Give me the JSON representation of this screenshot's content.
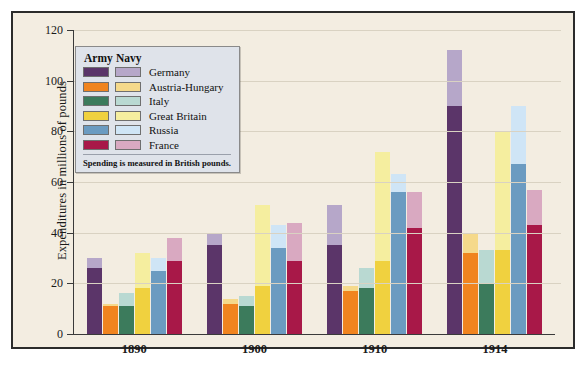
{
  "chart_data": {
    "type": "bar",
    "title": "",
    "subtitle": "",
    "xlabel": "",
    "ylabel": "Expenditures in millions of pounds",
    "categories": [
      "1890",
      "1900",
      "1910",
      "1914"
    ],
    "ylim": [
      0,
      120
    ],
    "yticks": [
      0,
      20,
      40,
      60,
      80,
      100,
      120
    ],
    "grid": true,
    "stacked": true,
    "stack_parts": [
      "Army",
      "Navy"
    ],
    "legend_position": "inside-top-left",
    "note": "Spending is measured in British pounds.",
    "series": [
      {
        "name": "Germany",
        "army_color": "#5b3569",
        "navy_color": "#b6a7c9",
        "army": [
          26,
          35,
          35,
          90
        ],
        "navy": [
          4,
          5,
          16,
          22
        ],
        "values": [
          30,
          40,
          51,
          112
        ]
      },
      {
        "name": "Austria-Hungary",
        "army_color": "#f0841f",
        "navy_color": "#f5d98b",
        "army": [
          11,
          12,
          17,
          32
        ],
        "navy": [
          1,
          2,
          2,
          8
        ],
        "values": [
          12,
          14,
          19,
          40
        ]
      },
      {
        "name": "Italy",
        "army_color": "#3c7b5c",
        "navy_color": "#b9d9d2",
        "army": [
          11,
          11,
          18,
          20
        ],
        "navy": [
          5,
          4,
          8,
          13
        ]
      },
      {
        "name": "Great Britain",
        "army_color": "#f0d13f",
        "navy_color": "#f5ee9f",
        "army": [
          18,
          19,
          29,
          33
        ],
        "navy": [
          14,
          32,
          43,
          47
        ],
        "values": [
          32,
          51,
          72,
          80
        ]
      },
      {
        "name": "Russia",
        "army_color": "#6b9bc1",
        "navy_color": "#cfe5f6",
        "army": [
          25,
          34,
          56,
          67
        ],
        "navy": [
          5,
          9,
          7,
          23
        ],
        "values": [
          30,
          43,
          63,
          90
        ]
      },
      {
        "name": "France",
        "army_color": "#a81848",
        "navy_color": "#d9a9c1",
        "army": [
          29,
          29,
          42,
          43
        ],
        "navy": [
          9,
          15,
          14,
          14
        ],
        "values": [
          38,
          44,
          56,
          57
        ]
      }
    ]
  },
  "legend": {
    "header_army": "Army",
    "header_navy": "Navy",
    "note": "Spending is measured in British pounds."
  },
  "axis": {
    "y_title": "Expenditures in millions of pounds",
    "y_ticks": [
      "120",
      "100",
      "80",
      "60",
      "40",
      "20",
      "0"
    ],
    "x_ticks": [
      "1890",
      "1900",
      "1910",
      "1914"
    ]
  }
}
